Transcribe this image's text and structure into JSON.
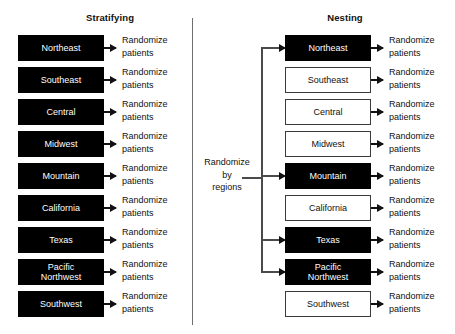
{
  "panels": {
    "left": {
      "title": "Stratifying",
      "rows": [
        {
          "region": "Northeast",
          "selected": true,
          "outcome": "Randomize\npatients"
        },
        {
          "region": "Southeast",
          "selected": true,
          "outcome": "Randomize\npatients"
        },
        {
          "region": "Central",
          "selected": true,
          "outcome": "Randomize\npatients"
        },
        {
          "region": "Midwest",
          "selected": true,
          "outcome": "Randomize\npatients"
        },
        {
          "region": "Mountain",
          "selected": true,
          "outcome": "Randomize\npatients"
        },
        {
          "region": "California",
          "selected": true,
          "outcome": "Randomize\npatients"
        },
        {
          "region": "Texas",
          "selected": true,
          "outcome": "Randomize\npatients"
        },
        {
          "region": "Pacific\nNorthwest",
          "selected": true,
          "outcome": "Randomize\npatients"
        },
        {
          "region": "Southwest",
          "selected": true,
          "outcome": "Randomize\npatients"
        }
      ]
    },
    "right": {
      "title": "Nesting",
      "randomize_node": "Randomize\nby\nregions",
      "rows": [
        {
          "region": "Northeast",
          "selected": true,
          "outcome": "Randomize\npatients"
        },
        {
          "region": "Southeast",
          "selected": false,
          "outcome": "Randomize\npatients"
        },
        {
          "region": "Central",
          "selected": false,
          "outcome": "Randomize\npatients"
        },
        {
          "region": "Midwest",
          "selected": false,
          "outcome": "Randomize\npatients"
        },
        {
          "region": "Mountain",
          "selected": true,
          "outcome": "Randomize\npatients"
        },
        {
          "region": "California",
          "selected": false,
          "outcome": "Randomize\npatients"
        },
        {
          "region": "Texas",
          "selected": true,
          "outcome": "Randomize\npatients"
        },
        {
          "region": "Pacific\nNorthwest",
          "selected": true,
          "outcome": "Randomize\npatients"
        },
        {
          "region": "Southwest",
          "selected": false,
          "outcome": "Randomize\npatients"
        }
      ]
    }
  },
  "layout": {
    "row_top_start": 35,
    "row_pitch": 32,
    "selected_row_indices": [
      0,
      4,
      6,
      7
    ]
  },
  "colors": {
    "selected_fill": "#000000",
    "selected_text": "#ffffff",
    "unselected_fill": "#ffffff",
    "unselected_border": "#3a3a3a",
    "connector": "#4a4a4a",
    "text": "#111111"
  }
}
